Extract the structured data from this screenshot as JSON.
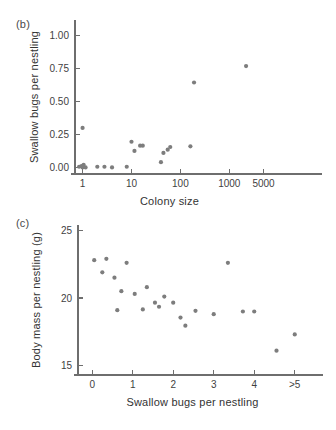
{
  "figure": {
    "background": "#ffffff",
    "dot_color": "#7d7d7d",
    "axis_color": "#6e6e6e"
  },
  "panels": {
    "b": {
      "label": "(b)",
      "xlabel": "Colony size",
      "ylabel": "Swallow bugs per nestling"
    },
    "c": {
      "label": "(c)",
      "xlabel": "Swallow bugs per nestling",
      "ylabel": "Body mass per nestling (g)"
    }
  },
  "chart_data": [
    {
      "type": "scatter",
      "panel": "b",
      "title": "",
      "xlabel": "Colony size",
      "ylabel": "Swallow bugs per nestling",
      "xscale": "log",
      "xlim": [
        0.7,
        9000
      ],
      "ylim": [
        -0.05,
        1.12
      ],
      "xticks": [
        1,
        10,
        100,
        1000,
        5000
      ],
      "xticklabels": [
        "1",
        "10",
        "100",
        "1000",
        "5000"
      ],
      "yticks": [
        0.0,
        0.25,
        0.5,
        0.75,
        1.0
      ],
      "yticklabels": [
        "0.00",
        "0.25",
        "0.50",
        "0.75",
        "1.00"
      ],
      "grid": false,
      "legend": null,
      "points": [
        {
          "x": 1.0,
          "y": 0.3
        },
        {
          "x": 0.85,
          "y": 0.005
        },
        {
          "x": 0.95,
          "y": 0.01
        },
        {
          "x": 1.0,
          "y": 0.0
        },
        {
          "x": 1.05,
          "y": 0.02
        },
        {
          "x": 1.15,
          "y": 0.0
        },
        {
          "x": 2.0,
          "y": 0.005
        },
        {
          "x": 2.8,
          "y": 0.005
        },
        {
          "x": 4.0,
          "y": 0.0
        },
        {
          "x": 8.0,
          "y": 0.005
        },
        {
          "x": 10.0,
          "y": 0.195
        },
        {
          "x": 11.5,
          "y": 0.125
        },
        {
          "x": 15.0,
          "y": 0.165
        },
        {
          "x": 17.0,
          "y": 0.165
        },
        {
          "x": 40.0,
          "y": 0.04
        },
        {
          "x": 45.0,
          "y": 0.11
        },
        {
          "x": 55.0,
          "y": 0.135
        },
        {
          "x": 62.0,
          "y": 0.155
        },
        {
          "x": 160.0,
          "y": 0.16
        },
        {
          "x": 190.0,
          "y": 0.645
        },
        {
          "x": 2200.0,
          "y": 0.77
        }
      ]
    },
    {
      "type": "scatter",
      "panel": "c",
      "title": "",
      "xlabel": "Swallow bugs per nestling",
      "ylabel": "Body mass per nestling (g)",
      "xscale": "linear",
      "xlim": [
        -0.35,
        5.5
      ],
      "ylim": [
        14.3,
        25.4
      ],
      "xticks": [
        0,
        1,
        2,
        3,
        4,
        5
      ],
      "xticklabels": [
        "0",
        "1",
        "2",
        "3",
        "4",
        ">5"
      ],
      "yticks": [
        15,
        20,
        25
      ],
      "yticklabels": [
        "15",
        "20",
        "25"
      ],
      "grid": false,
      "legend": null,
      "points": [
        {
          "x": 0.05,
          "y": 22.8
        },
        {
          "x": 0.25,
          "y": 21.9
        },
        {
          "x": 0.35,
          "y": 22.9
        },
        {
          "x": 0.55,
          "y": 21.5
        },
        {
          "x": 0.62,
          "y": 19.1
        },
        {
          "x": 0.72,
          "y": 20.5
        },
        {
          "x": 0.85,
          "y": 22.6
        },
        {
          "x": 1.05,
          "y": 20.3
        },
        {
          "x": 1.25,
          "y": 19.15
        },
        {
          "x": 1.35,
          "y": 20.8
        },
        {
          "x": 1.55,
          "y": 19.65
        },
        {
          "x": 1.65,
          "y": 19.35
        },
        {
          "x": 1.78,
          "y": 20.1
        },
        {
          "x": 2.0,
          "y": 19.65
        },
        {
          "x": 2.18,
          "y": 18.55
        },
        {
          "x": 2.3,
          "y": 17.95
        },
        {
          "x": 2.55,
          "y": 19.05
        },
        {
          "x": 3.0,
          "y": 18.8
        },
        {
          "x": 3.35,
          "y": 22.6
        },
        {
          "x": 3.72,
          "y": 19.0
        },
        {
          "x": 4.0,
          "y": 19.0
        },
        {
          "x": 4.55,
          "y": 16.1
        },
        {
          "x": 5.0,
          "y": 17.3
        }
      ]
    }
  ]
}
